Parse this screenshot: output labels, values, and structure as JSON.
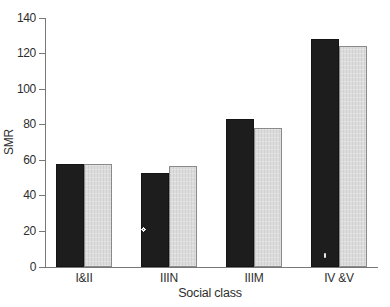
{
  "chart_data": {
    "type": "bar",
    "title": "",
    "xlabel": "Social class",
    "ylabel": "SMR",
    "categories": [
      "I&II",
      "IIIN",
      "IIIM",
      "IV &V"
    ],
    "series": [
      {
        "name": "black",
        "color": "#1d1d1d",
        "values": [
          58,
          53,
          83,
          128
        ]
      },
      {
        "name": "grey",
        "color": "#dcdcdc",
        "values": [
          58,
          57,
          78,
          124
        ]
      }
    ],
    "ylim": [
      0,
      140
    ],
    "yticks": [
      0,
      20,
      40,
      60,
      80,
      100,
      120,
      140
    ],
    "grid": false,
    "legend": "none"
  },
  "colors": {
    "background": "#ffffff",
    "axis": "#787878",
    "text": "#2e2e2e",
    "bar_black": "#1d1d1d",
    "bar_grey_fill": "#dcdcdc",
    "bar_grey_border": "#8a8a8a"
  }
}
